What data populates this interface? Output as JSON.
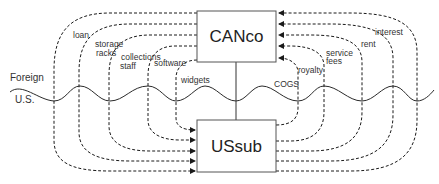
{
  "diagram": {
    "entities": {
      "parent": "CANco",
      "subsidiary": "USsub"
    },
    "regions": {
      "upper": "Foreign",
      "lower": "U.S."
    },
    "flows_parent_to_sub": [
      {
        "label": "loan"
      },
      {
        "label_line1": "storage",
        "label_line2": "racks"
      },
      {
        "label_line1": "collections",
        "label_line2": "staff"
      },
      {
        "label": "software"
      },
      {
        "label": "widgets"
      }
    ],
    "flows_sub_to_parent": [
      {
        "label_a": "COGS",
        "label_b": "royalty"
      },
      {
        "label_line1": "service",
        "label_line2": "fees"
      },
      {
        "label": "rent"
      },
      {
        "label": ""
      },
      {
        "label": "interest"
      }
    ],
    "colors": {
      "line": "#1a1a1a",
      "box_border": "#555555",
      "text": "#333333"
    }
  }
}
